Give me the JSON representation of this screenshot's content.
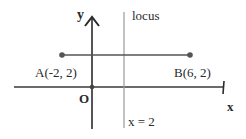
{
  "diagram": {
    "axes": {
      "x_label": "x",
      "y_label": "y",
      "origin_label": "O"
    },
    "points": [
      {
        "name": "A",
        "label": "A(-2, 2)",
        "x": -2,
        "y": 2
      },
      {
        "name": "B",
        "label": "B(6, 2)",
        "x": 6,
        "y": 2
      }
    ],
    "locus": {
      "label": "locus",
      "equation": "x = 2",
      "x": 2
    },
    "colors": {
      "axis": "#2b2b2b",
      "segment": "#555555",
      "locus_line": "#9a9a9a",
      "point": "#555555",
      "text": "#2a2a2a",
      "background": "#ffffff"
    }
  }
}
